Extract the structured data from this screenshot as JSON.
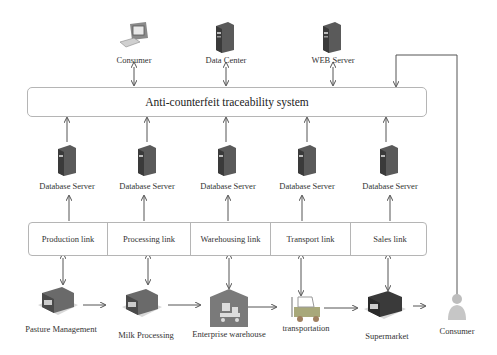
{
  "top_nodes": [
    {
      "label": "Consumer",
      "icon": "computer-icon"
    },
    {
      "label": "Data Center",
      "icon": "server-icon"
    },
    {
      "label": "WEB Server",
      "icon": "server-icon"
    }
  ],
  "system": {
    "label": "Anti-counterfeit traceability system"
  },
  "database_servers": [
    {
      "label": "Database Server",
      "icon": "server-icon"
    },
    {
      "label": "Database Server",
      "icon": "server-icon"
    },
    {
      "label": "Database Server",
      "icon": "server-icon"
    },
    {
      "label": "Database Server",
      "icon": "server-icon"
    },
    {
      "label": "Database Server",
      "icon": "server-icon"
    }
  ],
  "links": [
    {
      "label": "Production link"
    },
    {
      "label": "Processing link"
    },
    {
      "label": "Warehousing link"
    },
    {
      "label": "Transport link"
    },
    {
      "label": "Sales link"
    }
  ],
  "supply_chain": [
    {
      "label": "Pasture Management",
      "icon": "building-icon"
    },
    {
      "label": "Milk Processing",
      "icon": "building-icon"
    },
    {
      "label": "Enterprise warehouse",
      "icon": "warehouse-icon"
    },
    {
      "label": "transportation",
      "icon": "forklift-icon"
    },
    {
      "label": "Supermarket",
      "icon": "building-icon"
    },
    {
      "label": "Consumer",
      "icon": "person-icon"
    }
  ],
  "colors": {
    "line": "#555555",
    "box_border": "#b5b5b5",
    "server_dark": "#4a4a4a",
    "warehouse": "#7a7a7a"
  }
}
